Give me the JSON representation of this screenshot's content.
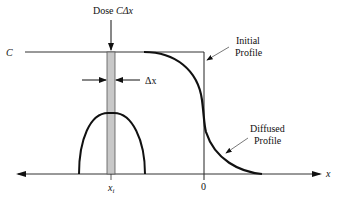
{
  "figure": {
    "dose_label": "Dose ",
    "dose_symbol": "CΔx",
    "c_label": "C",
    "dx_label": "Δx",
    "initial_profile_line1": "Initial",
    "initial_profile_line2": "Profile",
    "diffused_profile_line1": "Diffused",
    "diffused_profile_line2": "Profile",
    "x_axis_label": "x",
    "origin_label": "0",
    "xi_label": "x",
    "xi_sub": "i",
    "colors": {
      "line": "#111111",
      "bar_fill": "#c8c8c8",
      "leader": "#555555"
    }
  }
}
